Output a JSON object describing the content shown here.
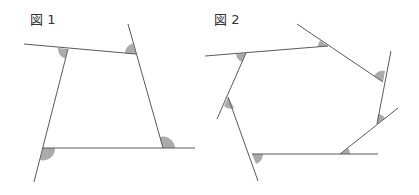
{
  "figures": [
    {
      "label": "図 1",
      "shape": "quadrilateral",
      "marked_angles": 4,
      "angle_type": "exterior angles"
    },
    {
      "label": "図 2",
      "shape": "heptagon",
      "marked_angles": 7,
      "angle_type": "exterior angles"
    }
  ],
  "colors": {
    "line": "#5a5a5a",
    "angle_fill": "#ababab",
    "background": "#ffffff"
  }
}
